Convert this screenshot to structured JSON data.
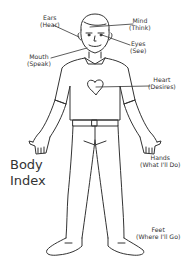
{
  "title": {
    "line1": "Body",
    "line2": "Index"
  },
  "labels": {
    "ears": {
      "name": "Ears",
      "meaning": "(Hear)"
    },
    "mind": {
      "name": "Mind",
      "meaning": "(Think)"
    },
    "eyes": {
      "name": "Eyes",
      "meaning": "(See)"
    },
    "mouth": {
      "name": "Mouth",
      "meaning": "(Speak)"
    },
    "heart": {
      "name": "Heart",
      "meaning": "(Desires)"
    },
    "hands": {
      "name": "Hands",
      "meaning": "(What I'll Do)"
    },
    "feet": {
      "name": "Feet",
      "meaning": "(Where I'll Go)"
    }
  },
  "colors": {
    "line": "#333333",
    "background": "#ffffff"
  }
}
